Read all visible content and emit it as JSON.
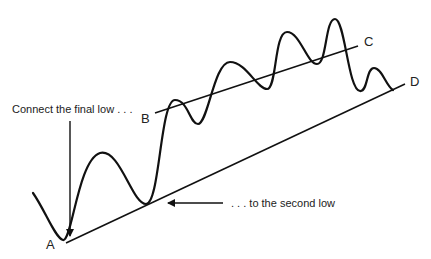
{
  "diagram": {
    "annotations": {
      "top": "Connect the final low . . .",
      "right": ". . . to the second low"
    },
    "points": {
      "a": "A",
      "b": "B",
      "c": "C",
      "d": "D"
    },
    "lines": [
      {
        "name": "A-D",
        "from": [
          66,
          243
        ],
        "to": [
          405,
          84
        ]
      },
      {
        "name": "B-C",
        "from": [
          155,
          113
        ],
        "to": [
          358,
          46
        ]
      }
    ],
    "colors": {
      "stroke": "#111111",
      "text": "#222222",
      "background": "#ffffff"
    }
  }
}
